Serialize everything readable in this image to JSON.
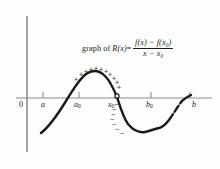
{
  "figure": {
    "caption_lead": "graph of ",
    "function_name": "R(x)",
    "equals": " = ",
    "numerator": "f(x) − f(x₀)",
    "denominator": "x − x₀",
    "numerator_parts": {
      "a": "f(x)",
      "minus": " − ",
      "b": "f(x",
      "b_sub": "0",
      "b_end": ")"
    },
    "denominator_parts": {
      "a": "x",
      "minus": " − ",
      "b": "x",
      "b_sub": "0"
    }
  },
  "axes": {
    "origin_label": "0",
    "x_tick_labels": [
      {
        "label": "a",
        "sub": "",
        "x": 43,
        "tick_x": 43
      },
      {
        "label": "a",
        "sub": "0",
        "x": 76,
        "tick_x": 79
      },
      {
        "label": "x",
        "sub": "0",
        "x": 112,
        "tick_x": 116
      },
      {
        "label": "b",
        "sub": "0",
        "x": 148,
        "tick_x": 151
      },
      {
        "label": "b",
        "sub": "",
        "x": 193,
        "tick_x": 190
      }
    ],
    "axis_color": "#8d8d8d",
    "curve_color": "#1a1a1a",
    "x_axis_y": 98,
    "x_axis_left": 16,
    "x_axis_right": 212,
    "y_axis_x": 27,
    "y_axis_top": 16,
    "y_axis_bottom": 152
  },
  "signs": {
    "plus_symbol": "+",
    "minus_symbol": "−",
    "plus_marks": [
      {
        "x": 74,
        "y": 76
      },
      {
        "x": 79,
        "y": 71
      },
      {
        "x": 84,
        "y": 68
      },
      {
        "x": 89,
        "y": 66
      },
      {
        "x": 94,
        "y": 65
      },
      {
        "x": 99,
        "y": 66
      },
      {
        "x": 104,
        "y": 68
      },
      {
        "x": 108,
        "y": 71
      },
      {
        "x": 112,
        "y": 75
      },
      {
        "x": 115,
        "y": 79
      },
      {
        "x": 117,
        "y": 84
      }
    ],
    "minus_marks": [
      {
        "x": 114,
        "y": 101
      },
      {
        "x": 112,
        "y": 106
      },
      {
        "x": 111,
        "y": 111
      },
      {
        "x": 110,
        "y": 116
      },
      {
        "x": 112,
        "y": 121
      },
      {
        "x": 115,
        "y": 126
      },
      {
        "x": 120,
        "y": 130
      }
    ]
  },
  "chart_data": {
    "type": "line",
    "xlabel": "",
    "ylabel": "",
    "x_tick_values": [
      "a",
      "a0",
      "x0",
      "b0",
      "b"
    ],
    "grid": false,
    "legend": null,
    "annotations": [
      "+ signs above curve between a0 and x0",
      "- signs below curve after x0"
    ],
    "curve_path": "M41,133 C50,126 58,114 66,101 C72,92 78,80 86,74 C92,70 99,70 105,76 C111,82 114,90 117,97 C120,106 123,117 128,124 C133,130 139,133 145,132 C150,131 154,128 159,128 C166,127 172,122 178,114 C183,107 187,101 190,97",
    "curve_dash_segment": "M168,120 C173,114 177,107 181,102"
  }
}
